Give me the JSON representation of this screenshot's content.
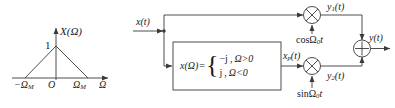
{
  "figure": {
    "type": "signal-flow-block-diagram"
  },
  "spectrum_plot": {
    "vertical_axis_label": "X(Ω)",
    "horizontal_axis_label": "Ω",
    "peak_value": "1",
    "origin_label": "O",
    "left_tick_label": "−Ω",
    "left_tick_sub": "M",
    "right_tick_label": "Ω",
    "right_tick_sub": "M",
    "shape": "triangle",
    "peak_at": "0"
  },
  "diagram": {
    "input_label": "x(t)",
    "output_label": "y(t)",
    "intermediate_label": "x",
    "intermediate_sub": "p",
    "intermediate_suffix": "(t)",
    "upper_branch_label": "y",
    "upper_branch_sub": "1",
    "upper_branch_suffix": "(t)",
    "lower_branch_label": "y",
    "lower_branch_sub": "2",
    "lower_branch_suffix": "(t)",
    "upper_carrier": "cosΩ",
    "upper_carrier_sub": "0",
    "upper_carrier_suffix": "t",
    "lower_carrier": "sinΩ",
    "lower_carrier_sub": "0",
    "lower_carrier_suffix": "t",
    "multiplier_symbol": "⊗",
    "adder_symbol": "⊕"
  },
  "block": {
    "function_name": "x(Ω)",
    "equals": "=",
    "case_1_value": "−j",
    "case_1_comma": ",",
    "case_1_condition": "Ω>0",
    "case_2_value": "j",
    "case_2_comma": ",",
    "case_2_condition": "Ω<0"
  },
  "colors": {
    "line": "#3a3a3a",
    "text": "#1a1a1a",
    "background": "#ffffff"
  }
}
